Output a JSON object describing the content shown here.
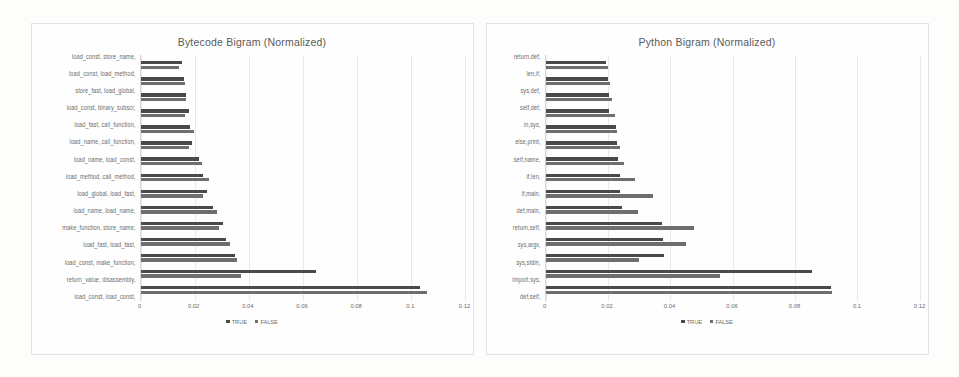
{
  "page": {
    "background": "#fdfdfc"
  },
  "legend": {
    "items": [
      {
        "label": "TRUE",
        "color": "#4a4a4a"
      },
      {
        "label": "FALSE",
        "color": "#6e6e6e"
      }
    ]
  },
  "axis": {
    "ticks": [
      "0",
      "0.02",
      "0.04",
      "0.06",
      "0.08",
      "0.1",
      "0.12"
    ],
    "min": 0,
    "max": 0.12
  },
  "chart_data": [
    {
      "type": "bar",
      "orientation": "horizontal",
      "title": "Bytecode Bigram (Normalized)",
      "xlabel": "",
      "ylabel": "",
      "xlim": [
        0,
        0.12
      ],
      "xticks": [
        0,
        0.02,
        0.04,
        0.06,
        0.08,
        0.1,
        0.12
      ],
      "grid": true,
      "legend_position": "bottom",
      "categories": [
        "load_const, store_name,",
        "load_const, load_method,",
        "store_fast, load_global,",
        "load_const, binary_subscr,",
        "load_fast, call_function,",
        "load_name, call_function,",
        "load_name, load_const,",
        "load_method, call_method,",
        "load_global, load_fast,",
        "load_name, load_name,",
        "make_function, store_name,",
        "load_fast, load_fast,",
        "load_const, make_function,",
        "return_value, disassembly,",
        "load_const, load_const,"
      ],
      "series": [
        {
          "name": "TRUE",
          "color": "#4a4a4a",
          "values": [
            0.0155,
            0.0162,
            0.017,
            0.0178,
            0.0182,
            0.019,
            0.0215,
            0.0232,
            0.0245,
            0.0268,
            0.0305,
            0.0318,
            0.035,
            0.065,
            0.1035
          ]
        },
        {
          "name": "FALSE",
          "color": "#6e6e6e",
          "values": [
            0.0142,
            0.0165,
            0.0168,
            0.0163,
            0.0198,
            0.0178,
            0.0228,
            0.0252,
            0.023,
            0.0282,
            0.029,
            0.033,
            0.0358,
            0.0372,
            0.106
          ]
        }
      ]
    },
    {
      "type": "bar",
      "orientation": "horizontal",
      "title": "Python Bigram (Normalized)",
      "xlabel": "",
      "ylabel": "",
      "xlim": [
        0,
        0.12
      ],
      "xticks": [
        0,
        0.02,
        0.04,
        0.06,
        0.08,
        0.1,
        0.12
      ],
      "grid": true,
      "legend_position": "bottom",
      "categories": [
        "return,def,",
        "len,if,",
        "sys,def,",
        "self,def,",
        "in,sys,",
        "else,print,",
        "self,name,",
        "if,len,",
        "if,main,",
        "def,main,",
        "return,self,",
        "sys,argv,",
        "sys,stdin,",
        "import,sys,",
        "def,self,"
      ],
      "series": [
        {
          "name": "TRUE",
          "color": "#4a4a4a",
          "values": [
            0.0195,
            0.02,
            0.0203,
            0.0205,
            0.0225,
            0.023,
            0.0232,
            0.0238,
            0.024,
            0.0245,
            0.0375,
            0.0378,
            0.038,
            0.0855,
            0.0915
          ]
        },
        {
          "name": "FALSE",
          "color": "#6e6e6e",
          "values": [
            0.02,
            0.0208,
            0.0212,
            0.0222,
            0.023,
            0.024,
            0.0252,
            0.0288,
            0.0345,
            0.0298,
            0.0478,
            0.0452,
            0.03,
            0.056,
            0.092
          ]
        }
      ]
    }
  ]
}
